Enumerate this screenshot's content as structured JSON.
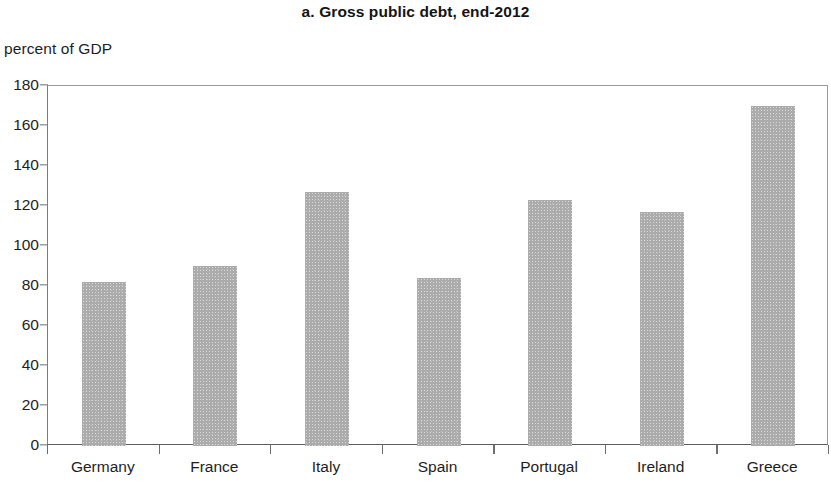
{
  "chart_data": {
    "type": "bar",
    "title": "a. Gross public debt, end-2012",
    "subtitle": "",
    "xlabel": "",
    "ylabel": "percent of GDP",
    "categories": [
      "Germany",
      "France",
      "Italy",
      "Spain",
      "Portugal",
      "Ireland",
      "Greece"
    ],
    "values": [
      82,
      90,
      127,
      84,
      123,
      117,
      170
    ],
    "ylim": [
      0,
      180
    ],
    "ytick_step": 20,
    "yticks": [
      0,
      20,
      40,
      60,
      80,
      100,
      120,
      140,
      160,
      180
    ],
    "ytick_labels": [
      "0",
      "20",
      "40",
      "60",
      "80",
      "100",
      "120",
      "140",
      "160",
      "180"
    ],
    "grid": false,
    "legend": null,
    "legend_position": "none",
    "bar_color": "#ababab",
    "axis_color": "#6e6e6e",
    "text_color": "#1e1e1e",
    "series": [
      {
        "name": "Gross public debt",
        "values": [
          82,
          90,
          127,
          84,
          123,
          117,
          170
        ]
      }
    ]
  }
}
